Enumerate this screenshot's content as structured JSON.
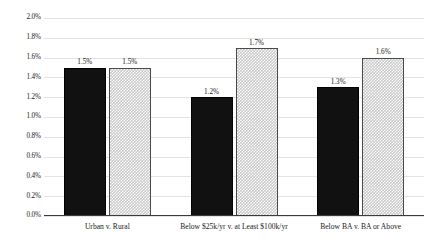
{
  "chart_data": {
    "type": "bar",
    "title": "",
    "subtitle": "",
    "xlabel": "",
    "ylabel": "",
    "ylim": [
      0.0,
      2.0
    ],
    "yunit": "%",
    "grid": true,
    "legend": "none",
    "orientation": "vertical",
    "grouping": "grouped",
    "categories": [
      "Urban v. Rural",
      "Below $25k/yr v. at Least $100k/yr",
      "Below BA v. BA or Above"
    ],
    "ytick_labels": [
      "0.0%",
      "0.2%",
      "0.4%",
      "0.6%",
      "0.8%",
      "1.0%",
      "1.2%",
      "1.4%",
      "1.6%",
      "1.8%",
      "2.0%"
    ],
    "ytick_values": [
      0.0,
      0.2,
      0.4,
      0.6,
      0.8,
      1.0,
      1.2,
      1.4,
      1.6,
      1.8,
      2.0
    ],
    "series": [
      {
        "name": "first-group",
        "style": "solid-black",
        "color": "#111111",
        "values": [
          1.5,
          1.2,
          1.3
        ],
        "labels": [
          "1.5%",
          "1.2%",
          "1.3%"
        ]
      },
      {
        "name": "second-group",
        "style": "checkered-gray",
        "color": "#c9c9c9",
        "values": [
          1.5,
          1.7,
          1.6
        ],
        "labels": [
          "1.5%",
          "1.7%",
          "1.6%"
        ]
      }
    ]
  }
}
